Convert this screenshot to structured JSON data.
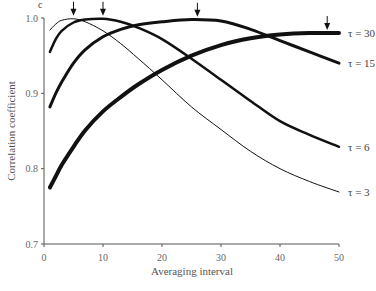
{
  "chart_data": {
    "type": "line",
    "panel_label": "c",
    "title": "",
    "xlabel": "Averaging interval",
    "ylabel": "Correlation coefficient",
    "xlim": [
      0,
      50
    ],
    "ylim": [
      0.7,
      1.0
    ],
    "xticks": [
      0,
      10,
      20,
      30,
      40,
      50
    ],
    "xtick_labels": [
      "0",
      "10",
      "20",
      "30",
      "40",
      "50"
    ],
    "yticks": [
      0.7,
      0.8,
      0.9,
      1.0
    ],
    "ytick_labels": [
      "0.7",
      "0.8",
      "0.9",
      "1.0"
    ],
    "grid": false,
    "legend": "inline labels at right end of curves",
    "x": [
      1,
      2,
      3,
      5,
      7,
      10,
      13,
      16,
      20,
      25,
      30,
      35,
      40,
      45,
      50
    ],
    "series": [
      {
        "name": "τ = 3",
        "label": "τ = 3",
        "stroke_width": 1,
        "peak_arrow_x": 5,
        "values": [
          0.984,
          0.992,
          0.997,
          0.999,
          0.995,
          0.983,
          0.966,
          0.946,
          0.918,
          0.882,
          0.852,
          0.823,
          0.8,
          0.783,
          0.769
        ]
      },
      {
        "name": "τ = 6",
        "label": "τ = 6",
        "stroke_width": 2.5,
        "peak_arrow_x": 10,
        "values": [
          0.955,
          0.972,
          0.983,
          0.994,
          0.998,
          0.999,
          0.995,
          0.987,
          0.972,
          0.946,
          0.918,
          0.89,
          0.863,
          0.845,
          0.829
        ]
      },
      {
        "name": "τ = 15",
        "label": "τ = 15",
        "stroke_width": 3,
        "peak_arrow_x": 26,
        "values": [
          0.882,
          0.9,
          0.915,
          0.94,
          0.958,
          0.975,
          0.985,
          0.991,
          0.995,
          0.998,
          0.996,
          0.985,
          0.97,
          0.955,
          0.94
        ]
      },
      {
        "name": "τ = 30",
        "label": "τ = 30",
        "stroke_width": 4,
        "peak_arrow_x": 48,
        "values": [
          0.775,
          0.79,
          0.805,
          0.829,
          0.851,
          0.876,
          0.895,
          0.912,
          0.931,
          0.95,
          0.964,
          0.973,
          0.978,
          0.98,
          0.98
        ]
      }
    ]
  }
}
